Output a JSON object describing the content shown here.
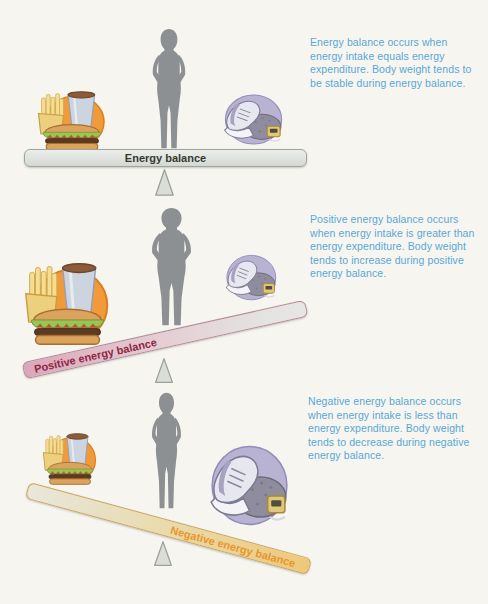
{
  "figure": {
    "caption_color": "#58a8d6",
    "panels": [
      {
        "name": "energy-balance",
        "beam_label": "Energy balance",
        "beam_tilt": "level",
        "description": "Energy balance occurs when energy intake equals energy expenditure. Body weight tends to be stable during energy balance.",
        "food_scale": "medium",
        "shoes_scale": "medium",
        "body_shape": "average"
      },
      {
        "name": "positive-energy-balance",
        "beam_label": "Positive energy balance",
        "beam_tilt": "left-down",
        "description": "Positive energy balance occurs when energy intake is greater than energy expenditure. Body weight tends to increase during positive energy balance.",
        "food_scale": "large",
        "shoes_scale": "small",
        "body_shape": "heavier"
      },
      {
        "name": "negative-energy-balance",
        "beam_label": "Negative energy balance",
        "beam_tilt": "right-down",
        "description": "Negative energy balance occurs when energy intake is less than energy expenditure. Body weight tends to decrease during negative energy balance.",
        "food_scale": "small",
        "shoes_scale": "large",
        "body_shape": "thinner"
      }
    ],
    "illustrations": {
      "person": "person-silhouette",
      "food": "fast-food-meal: fries, soft drink, hamburger on orange circle",
      "shoes": "athletic-shoe with weight and pedometer on purple circle",
      "fulcrum": "triangle-fulcrum"
    },
    "colors": {
      "beam_neutral_fill": "#e3e6e2",
      "beam_positive_left": "#dca6ba",
      "beam_positive_right": "#e7e6e4",
      "beam_negative_left": "#e9e7dc",
      "beam_negative_right": "#eec87a",
      "neutral_label": "#343b34",
      "positive_label": "#8e2746",
      "negative_label": "#e8962d",
      "silhouette_gray": "#8d9093",
      "food_circle_orange": "#f09a3a",
      "shoes_circle_purple": "#b9b3d3"
    }
  }
}
